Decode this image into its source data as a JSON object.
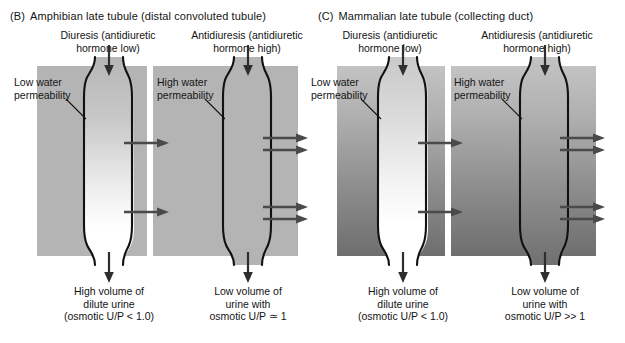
{
  "figure": {
    "panels": [
      {
        "tag": "(B)",
        "title": "Amphibian late tubule (distal convoluted tubule)",
        "columns": [
          {
            "heading_line1": "Diuresis (antidiuretic",
            "heading_line2": "hormone low)",
            "permeability_line1": "Low water",
            "permeability_line2": "permeability",
            "caption_line1": "High volume of",
            "caption_line2": "dilute urine",
            "caption_line3": "(osmotic U/P < 1.0)",
            "efflux_arrow_count": 2,
            "lumen_fill": "white-gradient",
            "background": "flat-gray"
          },
          {
            "heading_line1": "Antidiuresis (antidiuretic",
            "heading_line2": "hormone high)",
            "permeability_line1": "High water",
            "permeability_line2": "permeability",
            "caption_line1": "Low volume of",
            "caption_line2": "urine with",
            "caption_line3": "osmotic U/P ≃ 1",
            "efflux_arrow_count": 4,
            "lumen_fill": "gray",
            "background": "flat-gray"
          }
        ]
      },
      {
        "tag": "(C)",
        "title": "Mammalian late tubule (collecting duct)",
        "columns": [
          {
            "heading_line1": "Diuresis (antidiuretic",
            "heading_line2": "hormone low)",
            "permeability_line1": "Low water",
            "permeability_line2": "permeability",
            "caption_line1": "High volume of",
            "caption_line2": "dilute urine",
            "caption_line3": "(osmotic U/P < 1.0)",
            "efflux_arrow_count": 2,
            "lumen_fill": "white-gradient",
            "background": "vertical-gradient"
          },
          {
            "heading_line1": "Antidiuresis (antidiuretic",
            "heading_line2": "hormone high)",
            "permeability_line1": "High water",
            "permeability_line2": "permeability",
            "caption_line1": "Low volume of",
            "caption_line2": "urine with",
            "caption_line3": "osmotic U/P >> 1",
            "efflux_arrow_count": 4,
            "lumen_fill": "gray",
            "background": "vertical-gradient"
          }
        ]
      }
    ],
    "colors": {
      "outline": "#111111",
      "arrow": "#3c3c3c",
      "efflux_arrow": "#4a4a4a",
      "band_flat": "#b4b4b4",
      "band_gradient_top": "#c3c3c3",
      "band_gradient_bottom": "#6e6e6e",
      "text": "#141414",
      "page": "#ffffff"
    }
  }
}
